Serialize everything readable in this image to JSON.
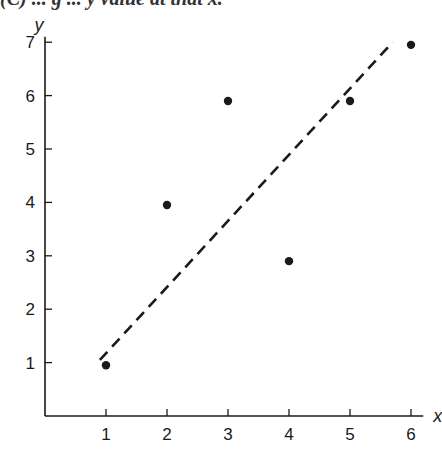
{
  "header": {
    "text": "(C) ... g ... y value at that x."
  },
  "colors": {
    "ink": "#1a1a1a",
    "background": "#ffffff"
  },
  "chart_data": {
    "type": "scatter",
    "title": "",
    "xlabel": "x",
    "ylabel": "y",
    "xlim": [
      0,
      6.2
    ],
    "ylim": [
      0,
      7.1
    ],
    "x_ticks": [
      1,
      2,
      3,
      4,
      5,
      6
    ],
    "y_ticks": [
      1,
      2,
      3,
      4,
      5,
      6,
      7
    ],
    "grid": false,
    "legend": null,
    "series": [
      {
        "name": "data points",
        "type": "scatter",
        "x": [
          1,
          2,
          3,
          4,
          5,
          6
        ],
        "y": [
          0.95,
          3.95,
          5.9,
          2.9,
          5.9,
          6.95
        ]
      },
      {
        "name": "fitted line (dashed)",
        "type": "line",
        "style": "dashed",
        "x": [
          0.9,
          5.7
        ],
        "y": [
          1.05,
          7.0
        ]
      }
    ]
  }
}
